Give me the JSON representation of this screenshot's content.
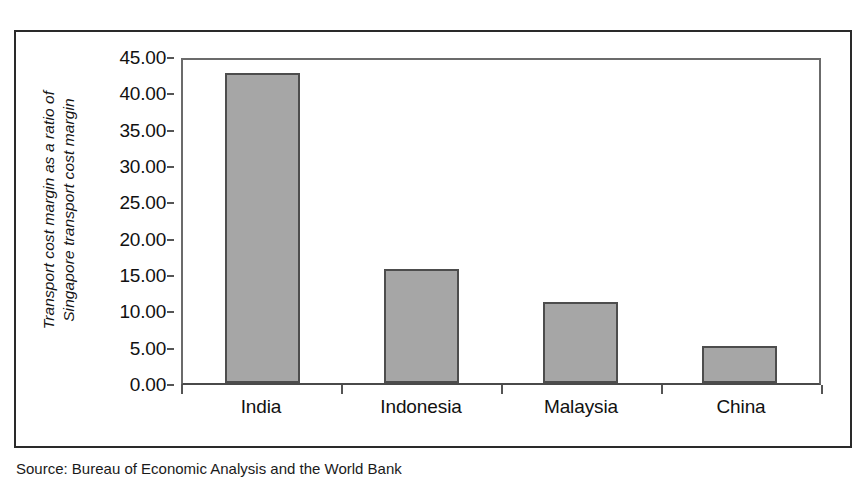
{
  "figure": {
    "caption": "Source: Bureau of Economic Analysis and the World Bank"
  },
  "chart_data": {
    "type": "bar",
    "title": "",
    "xlabel": "",
    "ylabel": "Transport cost margin as a ratio of Singapore transport cost margin",
    "ylabel_lines": [
      "Transport cost margin as a ratio of",
      "Singapore transport cost margin"
    ],
    "categories": [
      "India",
      "Indonesia",
      "Malaysia",
      "China"
    ],
    "values": [
      42.7,
      15.7,
      11.2,
      5.1
    ],
    "ylim": [
      0,
      45
    ],
    "ytick_step": 5,
    "yticks": [
      45.0,
      40.0,
      35.0,
      30.0,
      25.0,
      20.0,
      15.0,
      10.0,
      5.0,
      0.0
    ],
    "ytick_labels": [
      "45.00",
      "40.00",
      "35.00",
      "30.00",
      "25.00",
      "20.00",
      "15.00",
      "10.00",
      "5.00",
      "0.00"
    ],
    "grid": false,
    "legend": null,
    "bar_color": "#a6a6a6",
    "bar_border_color": "#4d4d4d",
    "axis_color": "#4a4a4a"
  }
}
